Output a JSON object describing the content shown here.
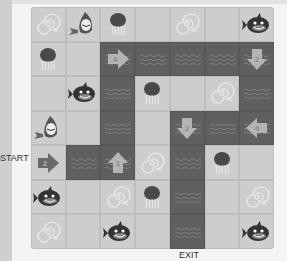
{
  "labels": {
    "start": "START",
    "exit": "EXIT"
  },
  "colors": {
    "tile": "#cdcdcd",
    "water": "#5f5f5f",
    "arrow": "#b4b4b4",
    "creature": "#4a4a4a"
  },
  "board": {
    "rows": 7,
    "cols": 7,
    "cells": [
      [
        {
          "type": "swirl"
        },
        {
          "type": "shark"
        },
        {
          "type": "jellyfish"
        },
        {
          "type": "empty"
        },
        {
          "type": "swirl"
        },
        {
          "type": "empty"
        },
        {
          "type": "orca"
        }
      ],
      [
        {
          "type": "jellyfish"
        },
        {
          "type": "empty"
        },
        {
          "type": "water",
          "arrow": "right",
          "value": "4"
        },
        {
          "type": "water"
        },
        {
          "type": "water"
        },
        {
          "type": "water"
        },
        {
          "type": "water",
          "arrow": "down",
          "value": "2"
        }
      ],
      [
        {
          "type": "empty"
        },
        {
          "type": "orca"
        },
        {
          "type": "water"
        },
        {
          "type": "jellyfish"
        },
        {
          "type": "empty"
        },
        {
          "type": "swirl"
        },
        {
          "type": "water"
        }
      ],
      [
        {
          "type": "shark"
        },
        {
          "type": "empty"
        },
        {
          "type": "water"
        },
        {
          "type": "empty"
        },
        {
          "type": "water",
          "arrow": "down",
          "value": "2"
        },
        {
          "type": "water"
        },
        {
          "type": "water",
          "arrow": "left",
          "value": "4"
        }
      ],
      [
        {
          "type": "arrow-tile",
          "arrow": "right",
          "value": "2"
        },
        {
          "type": "water"
        },
        {
          "type": "water",
          "arrow": "up",
          "value": "1"
        },
        {
          "type": "swirl"
        },
        {
          "type": "water"
        },
        {
          "type": "jellyfish"
        },
        {
          "type": "empty"
        }
      ],
      [
        {
          "type": "orca"
        },
        {
          "type": "empty"
        },
        {
          "type": "swirl"
        },
        {
          "type": "jellyfish"
        },
        {
          "type": "water"
        },
        {
          "type": "empty"
        },
        {
          "type": "swirl"
        }
      ],
      [
        {
          "type": "swirl"
        },
        {
          "type": "empty"
        },
        {
          "type": "orca"
        },
        {
          "type": "empty"
        },
        {
          "type": "water"
        },
        {
          "type": "empty"
        },
        {
          "type": "orca"
        }
      ]
    ]
  }
}
